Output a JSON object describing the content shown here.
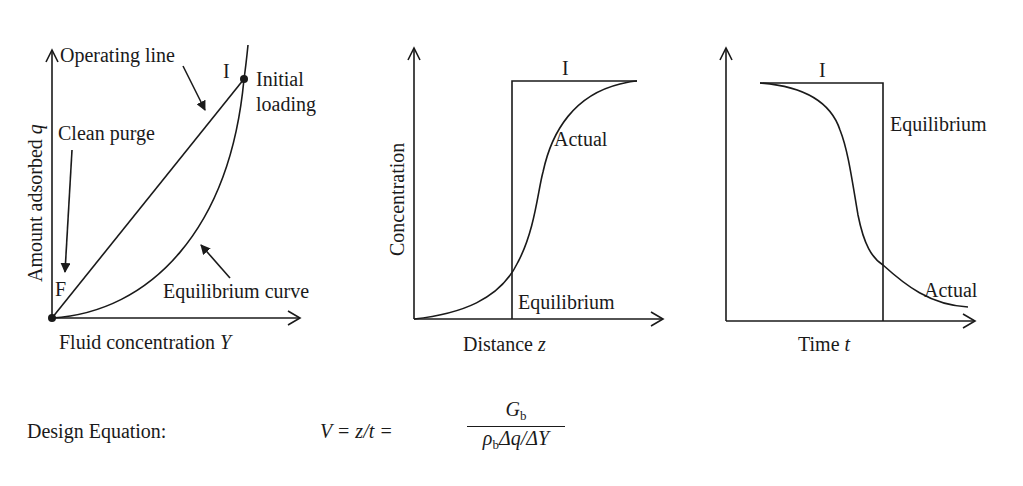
{
  "panels": {
    "isotherm": {
      "y_axis_label": "Amount adsorbed",
      "y_axis_var": "q",
      "x_axis_label": "Fluid concentration",
      "x_axis_var": "Y",
      "operating_line_label": "Operating line",
      "equilibrium_curve_label": "Equilibrium curve",
      "clean_purge_label": "Clean purge",
      "point_F": "F",
      "point_I": "I",
      "initial_loading_line1": "Initial",
      "initial_loading_line2": "loading"
    },
    "distance_profile": {
      "y_axis_label": "Concentration",
      "x_axis_label": "Distance",
      "x_axis_var": "z",
      "top_label": "I",
      "actual_label": "Actual",
      "equilibrium_label": "Equilibrium"
    },
    "time_profile": {
      "x_axis_label": "Time",
      "x_axis_var": "t",
      "top_label": "I",
      "equilibrium_label": "Equilibrium",
      "actual_label": "Actual"
    }
  },
  "equation": {
    "label": "Design Equation:",
    "lhs": "V = z/t =",
    "numerator": "G",
    "numerator_sub": "b",
    "denominator_rho": "ρ",
    "denominator_sub": "b",
    "denominator_rest": "Δq/ΔY"
  },
  "colors": {
    "ink": "#1a1a1a",
    "background": "#ffffff"
  }
}
